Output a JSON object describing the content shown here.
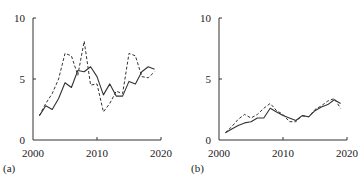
{
  "chart_data": [
    {
      "type": "line",
      "panel_label": "(a)",
      "title": "",
      "xlabel": "",
      "ylabel": "",
      "xlim": [
        2000,
        2020
      ],
      "ylim": [
        0,
        10
      ],
      "xticks": [
        2000,
        2010,
        2020
      ],
      "yticks": [
        0,
        5,
        10
      ],
      "xtick_labels": [
        "2000",
        "2010",
        "2020"
      ],
      "ytick_labels": [
        "0",
        "5",
        "10"
      ],
      "grid": false,
      "legend": null,
      "x": [
        2001,
        2002,
        2003,
        2004,
        2005,
        2006,
        2007,
        2008,
        2009,
        2010,
        2011,
        2012,
        2013,
        2014,
        2015,
        2016,
        2017,
        2018,
        2019
      ],
      "series": [
        {
          "name": "solid",
          "style": "solid",
          "values": [
            2.0,
            2.8,
            2.5,
            3.4,
            4.7,
            4.3,
            5.7,
            5.6,
            6.0,
            5.2,
            3.7,
            4.6,
            3.6,
            3.6,
            4.8,
            4.6,
            5.6,
            6.0,
            5.8
          ]
        },
        {
          "name": "dashed",
          "style": "dashed",
          "values": [
            2.0,
            3.0,
            3.8,
            5.0,
            7.1,
            6.9,
            5.3,
            8.1,
            4.5,
            4.6,
            2.3,
            3.0,
            4.0,
            3.8,
            7.1,
            6.9,
            5.2,
            5.1,
            5.6
          ]
        }
      ]
    },
    {
      "type": "line",
      "panel_label": "(b)",
      "title": "",
      "xlabel": "",
      "ylabel": "",
      "xlim": [
        2000,
        2020
      ],
      "ylim": [
        0,
        10
      ],
      "xticks": [
        2000,
        2010,
        2020
      ],
      "yticks": [
        0,
        5,
        10
      ],
      "xtick_labels": [
        "2000",
        "2010",
        "2020"
      ],
      "ytick_labels": [
        "0",
        "5",
        "10"
      ],
      "grid": false,
      "legend": null,
      "x": [
        2001,
        2002,
        2003,
        2004,
        2005,
        2006,
        2007,
        2008,
        2009,
        2010,
        2011,
        2012,
        2013,
        2014,
        2015,
        2016,
        2017,
        2018,
        2019
      ],
      "series": [
        {
          "name": "solid",
          "style": "solid",
          "values": [
            0.6,
            0.9,
            1.2,
            1.4,
            1.5,
            1.8,
            1.8,
            2.6,
            2.3,
            2.0,
            1.8,
            1.6,
            2.0,
            1.9,
            2.4,
            2.7,
            2.9,
            3.3,
            3.0
          ]
        },
        {
          "name": "dashed",
          "style": "dashed",
          "values": [
            0.6,
            1.1,
            1.7,
            2.1,
            1.8,
            2.1,
            2.6,
            3.0,
            2.4,
            2.1,
            1.5,
            1.5,
            2.0,
            1.9,
            2.5,
            2.8,
            3.2,
            3.4,
            2.6
          ]
        }
      ]
    }
  ],
  "layout": {
    "panels": [
      {
        "x0": 33,
        "x1": 161,
        "y0": 140,
        "y1": 18
      },
      {
        "x0": 219,
        "x1": 347,
        "y0": 140,
        "y1": 18
      }
    ]
  }
}
